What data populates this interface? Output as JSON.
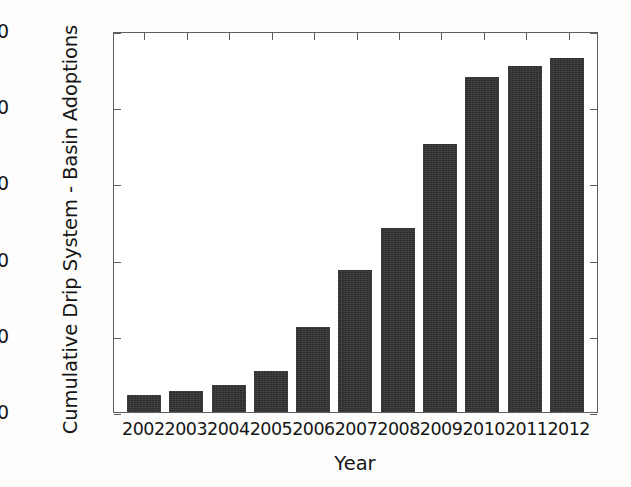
{
  "chart_data": {
    "type": "bar",
    "title": "",
    "xlabel": "Year",
    "ylabel": "Cumulative Drip System - Basin Adoptions",
    "categories": [
      "2002",
      "2003",
      "2004",
      "2005",
      "2006",
      "2007",
      "2008",
      "2009",
      "2010",
      "2011",
      "2012"
    ],
    "values": [
      11,
      14,
      18,
      27,
      56,
      93,
      121,
      176,
      220,
      227,
      232
    ],
    "ylim": [
      0,
      250
    ],
    "yticks": [
      0,
      50,
      100,
      150,
      200,
      250
    ],
    "ytick_labels": [
      "0",
      "50",
      "100",
      "150",
      "200",
      "250"
    ],
    "grid": false,
    "legend": null,
    "bar_color": "#333333",
    "axis_color": "#5d5d5d",
    "text_color": "#161616",
    "background": "#ffffff"
  }
}
